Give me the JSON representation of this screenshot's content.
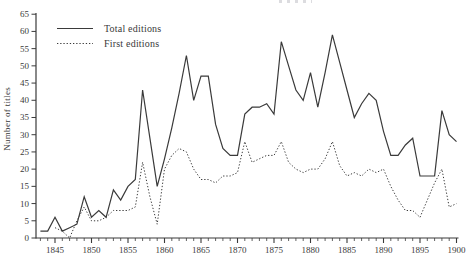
{
  "figure": {
    "y_axis_label": "Number of titles"
  },
  "colors": {
    "line": "#3a3a3a",
    "text": "#3a3a3a",
    "background": "#ffffff"
  },
  "chart_data": {
    "type": "line",
    "title": "",
    "xlabel": "",
    "ylabel": "Number of titles",
    "x_range": [
      1843,
      1900
    ],
    "ylim": [
      0,
      65
    ],
    "y_ticks": [
      0,
      5,
      10,
      15,
      20,
      25,
      30,
      35,
      40,
      45,
      50,
      55,
      60,
      65
    ],
    "x_major_ticks": [
      1845,
      1850,
      1855,
      1860,
      1865,
      1870,
      1875,
      1880,
      1885,
      1890,
      1895,
      1900
    ],
    "grid": false,
    "legend_position": "top-left",
    "series": [
      {
        "name": "Total editions",
        "line_style": "solid",
        "x": [
          1843,
          1844,
          1845,
          1846,
          1847,
          1848,
          1849,
          1850,
          1851,
          1852,
          1853,
          1854,
          1855,
          1856,
          1857,
          1858,
          1859,
          1860,
          1861,
          1862,
          1863,
          1864,
          1865,
          1866,
          1867,
          1868,
          1869,
          1870,
          1871,
          1872,
          1873,
          1874,
          1875,
          1876,
          1877,
          1878,
          1879,
          1880,
          1881,
          1882,
          1883,
          1884,
          1885,
          1886,
          1887,
          1888,
          1889,
          1890,
          1891,
          1892,
          1893,
          1894,
          1895,
          1896,
          1897,
          1898,
          1899,
          1900
        ],
        "values": [
          2,
          2,
          6,
          2,
          3,
          4,
          12,
          6,
          8,
          6,
          14,
          11,
          15,
          17,
          43,
          29,
          15,
          23,
          32,
          42,
          53,
          40,
          47,
          47,
          33,
          26,
          24,
          24,
          36,
          38,
          38,
          39,
          36,
          57,
          50,
          43,
          40,
          48,
          38,
          48,
          59,
          51,
          43,
          35,
          39,
          42,
          40,
          31,
          24,
          24,
          27,
          29,
          18,
          18,
          18,
          37,
          30,
          28
        ]
      },
      {
        "name": "First editions",
        "line_style": "dotted",
        "x": [
          1845,
          1846,
          1847,
          1848,
          1849,
          1850,
          1851,
          1852,
          1853,
          1854,
          1855,
          1856,
          1857,
          1858,
          1859,
          1860,
          1861,
          1862,
          1863,
          1864,
          1865,
          1866,
          1867,
          1868,
          1869,
          1870,
          1871,
          1872,
          1873,
          1874,
          1875,
          1876,
          1877,
          1878,
          1879,
          1880,
          1881,
          1882,
          1883,
          1884,
          1885,
          1886,
          1887,
          1888,
          1889,
          1890,
          1891,
          1892,
          1893,
          1894,
          1895,
          1896,
          1897,
          1898,
          1899,
          1900
        ],
        "values": [
          3,
          2,
          0,
          5,
          9,
          5,
          5,
          6,
          8,
          8,
          8,
          9,
          22,
          12,
          4,
          20,
          24,
          26,
          25,
          20,
          17,
          17,
          16,
          18,
          18,
          19,
          28,
          22,
          23,
          24,
          24,
          28,
          22,
          20,
          19,
          20,
          20,
          23,
          28,
          21,
          18,
          19,
          18,
          20,
          19,
          20,
          15,
          11,
          8,
          8,
          6,
          11,
          16,
          20,
          9,
          10
        ]
      }
    ]
  }
}
